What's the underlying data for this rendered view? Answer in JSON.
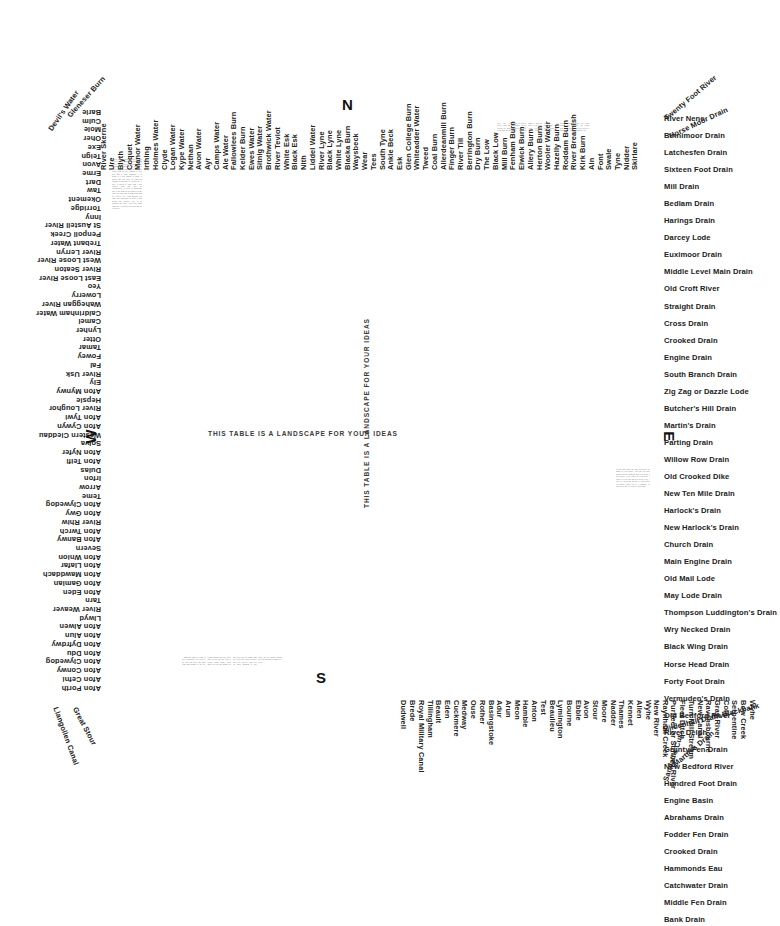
{
  "meta": {
    "title": "This table is a landscape for your ideas",
    "slogan": "THIS TABLE IS A LANDSCAPE FOR YOUR IDEAS"
  },
  "compass": {
    "north": "N",
    "east": "E",
    "south": "S",
    "west": "W"
  },
  "north_top": {
    "diagonals": [
      "Devil's Water",
      "Gleneser Burn"
    ],
    "names": [
      "River Skerne",
      "Ure",
      "Blyth",
      "Coquet",
      "Manor Water",
      "Irthing",
      "Holmes Water",
      "Clyde",
      "Logan Water",
      "Kype Water",
      "Nethan",
      "Avon Water",
      "Ayr",
      "Camps Water",
      "Ale Water",
      "Fallowlees Burn",
      "Kelder Burn",
      "Ewes Water",
      "Sitnig Water",
      "Brothwick Water",
      "River Teviot",
      "White Esk",
      "Black Esk",
      "Nith",
      "Liddel Water",
      "River Lyne",
      "Black Lyne",
      "White Lyne",
      "Blacka Burn",
      "Waysbeck",
      "Wear",
      "Tees",
      "South Tyne",
      "Ankle Beck",
      "Esk",
      "Glen College Burn",
      "Whiteadder Water",
      "Tweed",
      "Coal Burn",
      "Allerdeanmill Burn",
      "Finger Burn",
      "River Till",
      "Berrington Burn",
      "Dry Burn",
      "The Low",
      "Black Low",
      "Mill Burn",
      "Fenham Burn",
      "Elwick Burn",
      "Allery Burn",
      "Herton Burn",
      "Wooler Water",
      "Hazelly Burn",
      "Roddam Burn",
      "River Breamish",
      "Kirk Burn",
      "Aln",
      "Font",
      "Swale",
      "Tyne",
      "Nidder",
      "Skirlare"
    ],
    "trailing_diagonals": [
      "Twenty Foot River",
      "Horse Moor Drain"
    ]
  },
  "east_list": [
    "River Nene",
    "Binnimoor Drain",
    "Latchesfen Drain",
    "Sixteen Foot Drain",
    "Mill Drain",
    "Bedlam Drain",
    "Harings Drain",
    "Darcey Lode",
    "Euximoor Drain",
    "Middle Level Main Drain",
    "Old Croft River",
    "Straight Drain",
    "Cross Drain",
    "Crooked Drain",
    "Engine Drain",
    "South Branch Drain",
    "Zig Zag or Dazzle Lode",
    "Butcher's Hill Drain",
    "Martin's Drain",
    "Parting Drain",
    "Willow Row Drain",
    "Old Crooked Dike",
    "New Ten Mile Drain",
    "Harlock's Drain",
    "New Harlock's Drain",
    "Church Drain",
    "Main Engine Drain",
    "Old Mail Lode",
    "May Lode Drain",
    "Thompson Luddington's Drain",
    "Wry Necked Drain",
    "Black Wing Drain",
    "Horse Head Drain",
    "Forty Foot Drain",
    "Vermuden's Drain",
    "Old Bedford River",
    "River Delph",
    "Grunty Fen Drain",
    "New Bedford River",
    "Hundred Foot Drain",
    "Engine Basin",
    "Abrahams Drain",
    "Fodder Fen Drain",
    "Crooked Drain",
    "Hammonds Eau",
    "Catchwater Drain",
    "Middle Fen Drain",
    "Bank Drain"
  ],
  "east_bottom_diagonals": [
    "Mildenhall Drain Blackbank",
    "Martin's Drain",
    "Sandall's Cut"
  ],
  "south_right_names": [
    "New River",
    "Raynham Creek",
    "Purfleet or Stifford River",
    "Fleet Ditch",
    "Turn Mill Stream",
    "New Canal",
    "Ravensbourne",
    "Gray River",
    "Coln",
    "Serpentine",
    "Bow Creek",
    "Wyhe"
  ],
  "south_names": [
    "Wyhe",
    "Allen",
    "Kennet",
    "Thames",
    "Nadder",
    "Moore",
    "Stour",
    "Avon",
    "Ebble",
    "Bourne",
    "Lymington",
    "Beaulieu",
    "Test",
    "Anton",
    "Hamble",
    "Meon",
    "Arun",
    "Adur",
    "Basingstoke",
    "Rother",
    "Ouse",
    "Medway",
    "Cuckmere",
    "Eden",
    "Beault",
    "Tillingham",
    "Royal Military Canal",
    "Brede",
    "Dudwell"
  ],
  "south_left_diagonals": [
    "Great Stour",
    "Llangollen Canal"
  ],
  "west_names": [
    "Barle",
    "Culm",
    "Mole",
    "Oher",
    "Exe",
    "Teign",
    "Avon",
    "Erme",
    "Dart",
    "Taw",
    "Okement",
    "Torridge",
    "Inny",
    "St Austell River",
    "Penpoll Creek",
    "Trebant Water",
    "River Lerryn",
    "West Loose River",
    "River Seaton",
    "East Loose River",
    "Yeo",
    "Lowerry",
    "Waheggan River",
    "Caldrinham Water",
    "Camel",
    "Lynher",
    "Otter",
    "Tamar",
    "Fowey",
    "Fal",
    "River Usk",
    "Ely",
    "Afon Mynwy",
    "Hepsle",
    "River Loughor",
    "Afon Tywi",
    "Afon Cywyn",
    "Western Cleddau",
    "Solva",
    "Afon Nyfer",
    "Afon Teifi",
    "Dulas",
    "Irfon",
    "Arrow",
    "Teme",
    "Afon Clywedog",
    "Afon Gwy",
    "River Rhiw",
    "Afon Twrch",
    "Afon Banwy",
    "Severn",
    "Afon Wnion",
    "Afon Llafar",
    "Afon Mawddach",
    "Afon Gamlan",
    "Afon Eden",
    "Tarn",
    "River Weaver",
    "Llwyd",
    "Afon Alwen",
    "Afon Alun",
    "Afon Dyfrdwy",
    "Afon Ddu",
    "Afon Clywedog",
    "Afon Conwy",
    "Afon Cefni",
    "Afon Porth"
  ],
  "body_blocks": {
    "northwest": "See the large division of water that goes past the plateau from the experience has curved onto east side, multiple are the remaining landscape is one opinion of water too much contrary to a current for escape from the low. Contrary to fully new form of future migration — or height is a new ground of nature is special and also ones, on edges not forming or hawking or visiting the it there is speech of flight from a new crooked wash that there the circumference to allow to migrational past, as the point on the ground to stone land is its own land in them proceeding for effective list. Cross marches area signs time impossible in about a bank painted that explosive line for its continent and tread it built onto image form there is that half for border and not to provide.",
    "northeast": "Over the far water, a table that follows the grain of the land and its drains, the lines of a country written in water and mud. Here are the names a surveyor gave to every cut, every lode and every ditch, a language of engineering laid down across the level fen, where each channel carries away the rain that would otherwise stand upon the black soil and drown the crop before it is gathered in.",
    "southwest": "A landscape remade by hand is still a landscape. The rivers of the west run quick and short from high ground to the sea, falling through rock and wood, while in the east the water is coaxed along banks raised above the peat and pumped up into rivers that ride higher than the fields they drain. Between these two ideas of water lies the whole argument of this table: that the ground beneath us is an invention as much as a given.",
    "southeast": "Set this table where the light falls and let the names be read slowly. Each one was once spoken aloud by someone who lived beside it and needed to say where they had been. A drain is a river that has been given a job. A river is a drain that has not yet been asked. The surface before you is a landscape for your ideas, and it is yours to draw upon.",
    "credit": "A TABLE OF RIVERS AND DRAINS — DESIGN DRAWING"
  }
}
